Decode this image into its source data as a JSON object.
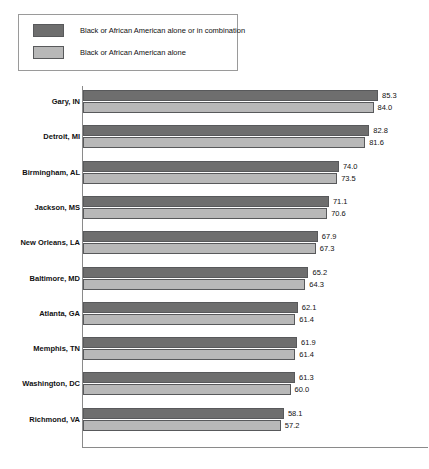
{
  "title_partial": "",
  "legend": {
    "items": [
      {
        "label": "Black or African American alone or in combination",
        "color": "#6e6e6e",
        "swatch": "legend-swatch-dark"
      },
      {
        "label": "Black or African American alone",
        "color": "#b8b8b8",
        "swatch": "legend-swatch-light"
      }
    ]
  },
  "chart_data": {
    "type": "bar",
    "orientation": "horizontal",
    "title": "",
    "xlabel": "",
    "ylabel": "",
    "grid": false,
    "legend_position": "top-left",
    "xlim": [
      0,
      100
    ],
    "categories": [
      "Gary, IN",
      "Detroit, MI",
      "Birmingham, AL",
      "Jackson, MS",
      "New Orleans, LA",
      "Baltimore, MD",
      "Atlanta, GA",
      "Memphis, TN",
      "Washington, DC",
      "Richmond, VA"
    ],
    "series": [
      {
        "name": "Black or African American alone or in combination",
        "color": "#6e6e6e",
        "values": [
          85.3,
          82.8,
          74.0,
          71.1,
          67.9,
          65.2,
          62.1,
          61.9,
          61.3,
          58.1
        ]
      },
      {
        "name": "Black or African American alone",
        "color": "#b8b8b8",
        "values": [
          84.0,
          81.6,
          73.5,
          70.6,
          67.3,
          64.3,
          61.4,
          61.4,
          60.0,
          57.2
        ]
      }
    ],
    "value_labels": [
      [
        "85.3",
        "84.0"
      ],
      [
        "82.8",
        "81.6"
      ],
      [
        "74.0",
        "73.5"
      ],
      [
        "71.1",
        "70.6"
      ],
      [
        "67.9",
        "67.3"
      ],
      [
        "65.2",
        "64.3"
      ],
      [
        "62.1",
        "61.4"
      ],
      [
        "61.9",
        "61.4"
      ],
      [
        "61.3",
        "60.0"
      ],
      [
        "58.1",
        "57.2"
      ]
    ]
  }
}
